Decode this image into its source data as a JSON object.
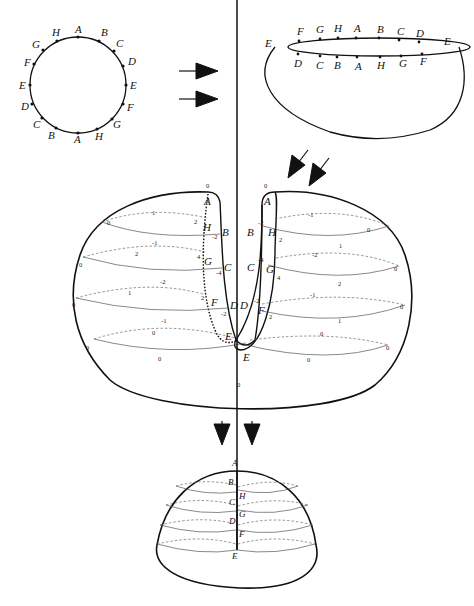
{
  "figure": {
    "stage1_circle": {
      "labels_top": [
        "H",
        "A",
        "B"
      ],
      "labels_right": [
        "C",
        "D",
        "E",
        "F",
        "G"
      ],
      "labels_bottom": [
        "H",
        "A",
        "B"
      ],
      "labels_left": [
        "C",
        "D",
        "E",
        "F",
        "G"
      ],
      "sequence_clockwise_from_top": [
        "A",
        "B",
        "C",
        "D",
        "E",
        "F",
        "G",
        "H",
        "A",
        "B",
        "C",
        "D",
        "E",
        "F",
        "G",
        "H"
      ]
    },
    "stage2_bowl": {
      "rim_back": [
        "F",
        "G",
        "H",
        "A",
        "B",
        "C",
        "D"
      ],
      "rim_front": [
        "D",
        "C",
        "B",
        "A",
        "H",
        "G",
        "F"
      ],
      "ends": [
        "E",
        "E"
      ]
    },
    "stage3_surface": {
      "left_slit_labels": [
        "A",
        "H",
        "G",
        "F",
        "E"
      ],
      "left_slot_labels": [
        "B",
        "C",
        "D"
      ],
      "right_slot_labels": [
        "A",
        "B",
        "C",
        "D",
        "E"
      ],
      "right_slit_labels": [
        "H",
        "G",
        "F"
      ],
      "top_zeros": [
        "0",
        "0"
      ],
      "left_numbers": {
        "row1": {
          "back": "1",
          "front": "-1",
          "edge": "0",
          "near_slit_back": "2",
          "near_slot": "-2"
        },
        "row2": {
          "back": "2",
          "front": "-2",
          "edge": "0",
          "near_slit_back": "4",
          "near_slot": "-4"
        },
        "row3": {
          "back": "1",
          "front": "-1",
          "edge": "0",
          "near_slit_back": "2",
          "near_slot": "-2"
        },
        "row4": {
          "back": "0",
          "front": "0",
          "edge": "0"
        }
      },
      "right_numbers": {
        "row1": {
          "back": "-1",
          "front": "1",
          "edge": "0",
          "near_slot": "-2",
          "near_slit": "2"
        },
        "row2": {
          "back": "-2",
          "front": "2",
          "edge": "0",
          "near_slot": "-4",
          "near_slit": "4"
        },
        "row3": {
          "back": "-1",
          "front": "1",
          "edge": "0",
          "near_slot": "-2",
          "near_slit": "2"
        },
        "row4": {
          "back": "0",
          "front": "0",
          "edge": "0"
        }
      },
      "bottom_zero": "0"
    },
    "stage4_hemisphere": {
      "top": "A",
      "left_labels": [
        "B",
        "C",
        "D"
      ],
      "right_labels": [
        "H",
        "G",
        "F"
      ],
      "bottom": "E"
    },
    "arrows": {
      "stage1_to_2": "right-arrow",
      "stage2_to_3": "down-left-arrow",
      "stage3_to_4": "down-arrow"
    }
  }
}
